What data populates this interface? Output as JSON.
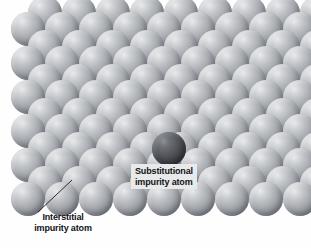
{
  "figure": {
    "type": "crystal-lattice-diagram",
    "background_color": "#fefefe",
    "host_atom_color": "#a0a4a9",
    "impurity_atom_color": "#46484e",
    "label_box_color": "#e8e9ea",
    "label_text_color": "#111214"
  },
  "labels": {
    "substitutional": {
      "line1": "Substitutional",
      "line2": "impurity atom"
    },
    "interstitial": {
      "line1": "Interstitial",
      "line2": "impurity atom"
    }
  },
  "lattice": {
    "atom_diameter": 34,
    "row_spacing": 27,
    "column_spacing": 34,
    "rows": [
      {
        "y": -4,
        "x0": 28,
        "count": 9
      },
      {
        "y": 12,
        "x0": 11,
        "count": 9
      },
      {
        "y": 30,
        "x0": 28,
        "count": 9
      },
      {
        "y": 46,
        "x0": 11,
        "count": 9
      },
      {
        "y": 64,
        "x0": 28,
        "count": 9
      },
      {
        "y": 80,
        "x0": 11,
        "count": 9
      },
      {
        "y": 98,
        "x0": 28,
        "count": 9
      },
      {
        "y": 114,
        "x0": 11,
        "count": 9
      },
      {
        "y": 132,
        "x0": 28,
        "count": 9
      },
      {
        "y": 148,
        "x0": 11,
        "count": 9
      },
      {
        "y": 166,
        "x0": 28,
        "count": 9
      },
      {
        "y": 182,
        "x0": 11,
        "count": 9
      }
    ],
    "substitutional_atom": {
      "x": 152,
      "y": 132,
      "size": 34
    },
    "interstitial_atom": {
      "x": 64,
      "y": 178,
      "size": 21
    }
  },
  "leader_line": {
    "from_x": 38,
    "from_y": 212,
    "to_x": 72,
    "to_y": 180,
    "color": "#2b2d31",
    "width": 1
  }
}
